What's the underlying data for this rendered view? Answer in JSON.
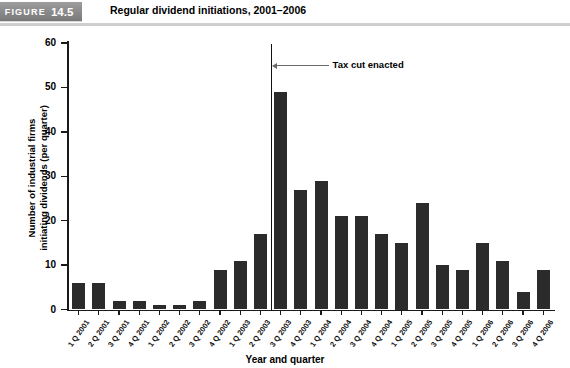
{
  "header": {
    "figure_label": "FIGURE",
    "figure_number": "14.5",
    "title": "Regular dividend initiations, 2001–2006"
  },
  "annotation": {
    "text": "Tax cut enacted",
    "at_category": "3 Q 2003"
  },
  "axes": {
    "y_title_line1": "Number of industrial firms",
    "y_title_line2": "initiating dividends (per quarter)",
    "x_title": "Year and quarter",
    "y_ticks": [
      "0",
      "10",
      "20",
      "30",
      "40",
      "50",
      "60"
    ]
  },
  "colors": {
    "bar": "#2b2b2b",
    "banner": "#8e8e8e",
    "axis": "#1a1a1a",
    "annotation_line": "#111111",
    "background": "#ffffff"
  },
  "chart_data": {
    "type": "bar",
    "title": "Regular dividend initiations, 2001–2006",
    "xlabel": "Year and quarter",
    "ylabel": "Number of industrial firms initiating dividends (per quarter)",
    "ylim": [
      0,
      60
    ],
    "ytick_step": 10,
    "grid": false,
    "legend": null,
    "annotations": [
      {
        "text": "Tax cut enacted",
        "x_category": "3 Q 2003",
        "type": "vertical-line-with-arrow"
      }
    ],
    "categories": [
      "1 Q 2001",
      "2 Q 2001",
      "3 Q 2001",
      "4 Q 2001",
      "1 Q 2002",
      "2 Q 2002",
      "3 Q 2002",
      "4 Q 2002",
      "1 Q 2003",
      "2 Q 2003",
      "3 Q 2003",
      "4 Q 2003",
      "1 Q 2004",
      "2 Q 2004",
      "3 Q 2004",
      "4 Q 2004",
      "1 Q 2005",
      "2 Q 2005",
      "3 Q 2005",
      "4 Q 2005",
      "1 Q 2006",
      "2 Q 2006",
      "3 Q 2006",
      "4 Q 2006"
    ],
    "values": [
      6,
      6,
      2,
      2,
      1,
      1,
      2,
      9,
      11,
      17,
      49,
      27,
      29,
      21,
      21,
      17,
      15,
      24,
      10,
      9,
      15,
      11,
      4,
      9
    ]
  }
}
